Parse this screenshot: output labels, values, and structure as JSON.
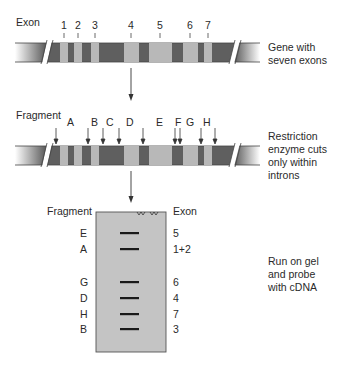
{
  "section1": {
    "heading": "Exon",
    "exon_numbers": [
      "1",
      "2",
      "3",
      "4",
      "5",
      "6",
      "7"
    ],
    "caption_line1": "Gene with",
    "caption_line2": "seven exons"
  },
  "section2": {
    "heading": "Fragment",
    "fragment_letters": [
      "A",
      "B",
      "C",
      "D",
      "E",
      "F",
      "G",
      "H"
    ],
    "caption_line1": "Restriction",
    "caption_line2": "enzyme cuts",
    "caption_line3": "only within",
    "caption_line4": "introns"
  },
  "gel": {
    "left_heading": "Fragment",
    "right_heading": "Exon",
    "bands": [
      {
        "fragment": "E",
        "exon": "5"
      },
      {
        "fragment": "A",
        "exon": "1+2"
      },
      {
        "fragment": "G",
        "exon": "6"
      },
      {
        "fragment": "D",
        "exon": "4"
      },
      {
        "fragment": "H",
        "exon": "7"
      },
      {
        "fragment": "B",
        "exon": "3"
      }
    ],
    "caption_line1": "Run on gel",
    "caption_line2": "and probe",
    "caption_line3": "with cDNA"
  },
  "colors": {
    "intron": "#5f5f5f",
    "exon": "#b8b8b8",
    "gel": "#c4c4c4",
    "band": "#1a1a1a",
    "text": "#2a2a2a"
  }
}
